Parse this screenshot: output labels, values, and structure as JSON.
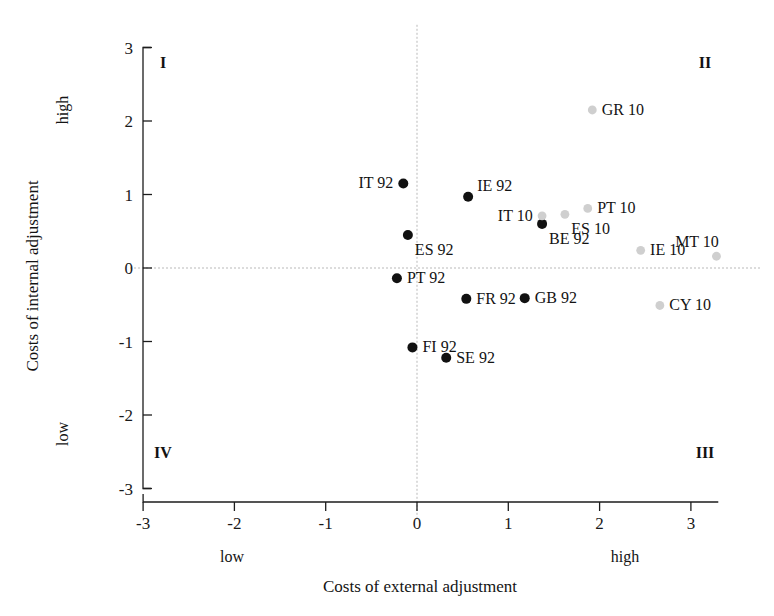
{
  "chart_data": {
    "type": "scatter",
    "title": "",
    "xlabel": "Costs of external adjustment",
    "ylabel": "Costs of internal adjustment",
    "xlim": [
      -3.4,
      3.4
    ],
    "ylim": [
      -3.2,
      3.2
    ],
    "xticks": [
      "-3",
      "-2",
      "-1",
      "0",
      "1",
      "2",
      "3"
    ],
    "xtick_values": [
      -3,
      -2,
      -1,
      0,
      1,
      2,
      3
    ],
    "yticks": [
      "3",
      "2",
      "1",
      "0",
      "-1",
      "-2",
      "-3"
    ],
    "ytick_values": [
      3,
      2,
      1,
      0,
      -1,
      -2,
      -3
    ],
    "grid": "zero-axes-only",
    "legend": "none",
    "axis_endpoint_labels": {
      "x_low": "low",
      "x_high": "high",
      "y_low": "low",
      "y_high": "high"
    },
    "quadrant_labels": [
      {
        "id": "I",
        "text": "I",
        "corner": "top-left"
      },
      {
        "id": "II",
        "text": "II",
        "corner": "top-right"
      },
      {
        "id": "III",
        "text": "III",
        "corner": "bottom-right"
      },
      {
        "id": "IV",
        "text": "IV",
        "corner": "bottom-left"
      }
    ],
    "series": [
      {
        "name": "1992",
        "color": "#111111",
        "marker": "filled-circle",
        "points": [
          {
            "label": "IT 92",
            "x": -0.15,
            "y": 1.15,
            "label_side": "left"
          },
          {
            "label": "ES 92",
            "x": -0.1,
            "y": 0.45,
            "label_side": "below-right"
          },
          {
            "label": "PT 92",
            "x": -0.22,
            "y": -0.14,
            "label_side": "right"
          },
          {
            "label": "IE 92",
            "x": 0.56,
            "y": 0.97,
            "label_side": "above-right"
          },
          {
            "label": "BE 92",
            "x": 1.37,
            "y": 0.6,
            "label_side": "below-right"
          },
          {
            "label": "FR 92",
            "x": 0.54,
            "y": -0.42,
            "label_side": "right"
          },
          {
            "label": "GB 92",
            "x": 1.18,
            "y": -0.41,
            "label_side": "right"
          },
          {
            "label": "FI 92",
            "x": -0.05,
            "y": -1.08,
            "label_side": "right"
          },
          {
            "label": "SE 92",
            "x": 0.32,
            "y": -1.22,
            "label_side": "right"
          }
        ]
      },
      {
        "name": "2010",
        "color": "#cfcfcf",
        "marker": "filled-circle",
        "points": [
          {
            "label": "GR 10",
            "x": 1.92,
            "y": 2.15,
            "label_side": "right"
          },
          {
            "label": "PT 10",
            "x": 1.87,
            "y": 0.81,
            "label_side": "right"
          },
          {
            "label": "ES 10",
            "x": 1.62,
            "y": 0.73,
            "label_side": "below-right"
          },
          {
            "label": "IT 10",
            "x": 1.37,
            "y": 0.71,
            "label_side": "left"
          },
          {
            "label": "IE 10",
            "x": 2.45,
            "y": 0.24,
            "label_side": "right"
          },
          {
            "label": "MT 10",
            "x": 3.28,
            "y": 0.16,
            "label_side": "above-left"
          },
          {
            "label": "CY 10",
            "x": 2.66,
            "y": -0.51,
            "label_side": "right"
          }
        ]
      }
    ]
  },
  "figure": {
    "caption_partial": ""
  }
}
